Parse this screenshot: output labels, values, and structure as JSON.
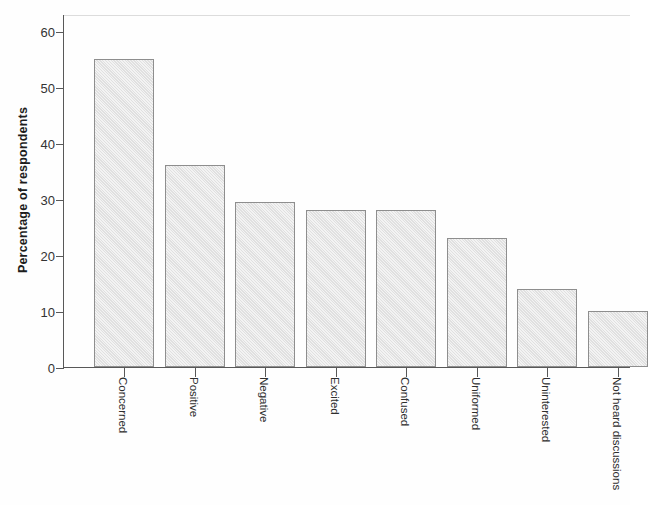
{
  "chart_data": {
    "type": "bar",
    "title": "",
    "xlabel": "",
    "ylabel": "Percentage of respondents",
    "categories": [
      "Concerned",
      "Positive",
      "Negative",
      "Excited",
      "Confused",
      "Uniformed",
      "Uninterested",
      "Not heard discussions"
    ],
    "values": [
      55,
      36,
      29.5,
      28,
      28,
      23,
      14,
      10
    ],
    "ylim": [
      0,
      63
    ],
    "yticks": [
      0,
      10,
      20,
      30,
      40,
      50,
      60
    ],
    "ytick_labels": [
      "0",
      "10",
      "20",
      "30",
      "40",
      "50",
      "60"
    ],
    "grid": false,
    "legend": false,
    "legend_position": "none",
    "bar_fill_color": "#e4e4e4",
    "bar_edge_color": "#8e8e8e",
    "axis_color": "#585858",
    "background_color": "#ffffff"
  }
}
